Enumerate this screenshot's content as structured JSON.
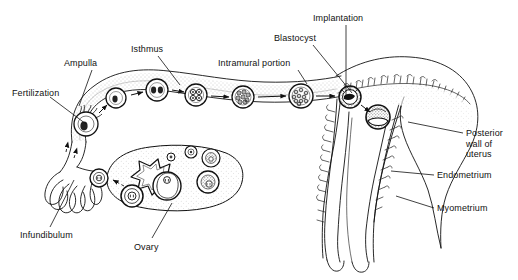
{
  "figure": {
    "title_visible": false,
    "background_color": "#ffffff",
    "ink_color": "#111111"
  },
  "labels": [
    {
      "id": "fertilization",
      "text": "Fertilization",
      "x": 12,
      "y": 88,
      "align": "left"
    },
    {
      "id": "ampulla",
      "text": "Ampulla",
      "x": 64,
      "y": 58,
      "align": "left"
    },
    {
      "id": "isthmus",
      "text": "Isthmus",
      "x": 131,
      "y": 44,
      "align": "left"
    },
    {
      "id": "intramural-portion",
      "text": "Intramural portion",
      "x": 218,
      "y": 58,
      "align": "left"
    },
    {
      "id": "blastocyst",
      "text": "Blastocyst",
      "x": 274,
      "y": 33,
      "align": "left"
    },
    {
      "id": "implantation",
      "text": "Implantation",
      "x": 313,
      "y": 13,
      "align": "left"
    },
    {
      "id": "posterior-wall",
      "text": "Posterior\nwall of\nuterus",
      "x": 466,
      "y": 128,
      "align": "left"
    },
    {
      "id": "endometrium",
      "text": "Endometrium",
      "x": 437,
      "y": 170,
      "align": "left"
    },
    {
      "id": "myometrium",
      "text": "Myometrium",
      "x": 437,
      "y": 203,
      "align": "left"
    },
    {
      "id": "infundibulum",
      "text": "Infundibulum",
      "x": 20,
      "y": 230,
      "align": "left"
    },
    {
      "id": "ovary",
      "text": "Ovary",
      "x": 134,
      "y": 242,
      "align": "left"
    }
  ],
  "leader_lines": [
    {
      "id": "leader-fertilization",
      "from": [
        62,
        97
      ],
      "to": [
        86,
        121
      ]
    },
    {
      "id": "leader-ampulla",
      "from": [
        92,
        70
      ],
      "to": [
        79,
        104
      ]
    },
    {
      "id": "leader-isthmus",
      "from": [
        158,
        56
      ],
      "to": [
        178,
        85
      ]
    },
    {
      "id": "leader-intramural",
      "from": [
        297,
        70
      ],
      "to": [
        306,
        83
      ]
    },
    {
      "id": "leader-blastocyst",
      "from": [
        313,
        45
      ],
      "to": [
        351,
        93
      ]
    },
    {
      "id": "leader-implantation",
      "from": [
        346,
        25
      ],
      "to": [
        346,
        97
      ]
    },
    {
      "id": "leader-posterior-wall",
      "from": [
        463,
        132
      ],
      "to": [
        408,
        121
      ]
    },
    {
      "id": "leader-endometrium",
      "from": [
        434,
        175
      ],
      "to": [
        393,
        171
      ]
    },
    {
      "id": "leader-myometrium",
      "from": [
        434,
        208
      ],
      "to": [
        396,
        196
      ]
    },
    {
      "id": "leader-infundibulum",
      "from": [
        50,
        227
      ],
      "to": [
        74,
        180
      ]
    },
    {
      "id": "leader-ovary",
      "from": [
        152,
        238
      ],
      "to": [
        172,
        203
      ]
    }
  ],
  "stages": [
    {
      "id": "stage-fertilization",
      "name": "fertilization-ovum-with-sperm",
      "cx": 86,
      "cy": 124,
      "r": 12,
      "cells": 1,
      "sperm": true
    },
    {
      "id": "stage-zygote",
      "name": "zygote",
      "cx": 116,
      "cy": 98,
      "r": 10,
      "cells": 1,
      "sperm": false
    },
    {
      "id": "stage-2cell",
      "name": "two-cell-stage",
      "cx": 157,
      "cy": 90,
      "r": 11,
      "cells": 2,
      "sperm": false
    },
    {
      "id": "stage-4cell",
      "name": "four-cell-stage",
      "cx": 196,
      "cy": 95,
      "r": 11,
      "cells": 4,
      "sperm": false
    },
    {
      "id": "stage-morula",
      "name": "morula",
      "cx": 243,
      "cy": 97,
      "r": 11,
      "cells": 9,
      "sperm": false
    },
    {
      "id": "stage-blastocyst",
      "name": "blastocyst",
      "cx": 301,
      "cy": 96,
      "r": 12,
      "cells": 14,
      "sperm": false
    },
    {
      "id": "stage-attaching",
      "name": "attaching-blastocyst",
      "cx": 350,
      "cy": 97,
      "r": 11,
      "cells": 0,
      "sperm": false
    },
    {
      "id": "stage-implanted",
      "name": "implanted-blastocyst",
      "cx": 378,
      "cy": 117,
      "r": 12,
      "cells": 0,
      "sperm": false
    }
  ],
  "arrows": [
    {
      "id": "arrow-1",
      "from": [
        97,
        112
      ],
      "to": [
        106,
        104
      ]
    },
    {
      "id": "arrow-2",
      "from": [
        131,
        94
      ],
      "to": [
        144,
        91
      ]
    },
    {
      "id": "arrow-3",
      "from": [
        171,
        90
      ],
      "to": [
        184,
        92
      ]
    },
    {
      "id": "arrow-4",
      "from": [
        210,
        96
      ],
      "to": [
        230,
        97
      ]
    },
    {
      "id": "arrow-5",
      "from": [
        257,
        97
      ],
      "to": [
        287,
        96
      ]
    },
    {
      "id": "arrow-6",
      "from": [
        315,
        96
      ],
      "to": [
        336,
        96
      ]
    },
    {
      "id": "arrow-7",
      "from": [
        360,
        105
      ],
      "to": [
        370,
        112
      ]
    },
    {
      "id": "arrow-ovulation",
      "from": [
        130,
        184
      ],
      "to": [
        113,
        178
      ]
    },
    {
      "id": "arrow-uptake",
      "from": [
        66,
        150
      ],
      "to": [
        69,
        140
      ]
    }
  ],
  "ovary": {
    "id": "ovary-body",
    "corpus_luteum": "jagged-star-shaped corpus luteum",
    "follicles": [
      {
        "id": "follicle-primordial-1",
        "cx": 171,
        "cy": 157,
        "r": 4,
        "stage": "primordial"
      },
      {
        "id": "follicle-primordial-2",
        "cx": 191,
        "cy": 152,
        "r": 6,
        "stage": "primary"
      },
      {
        "id": "follicle-secondary",
        "cx": 211,
        "cy": 158,
        "r": 9,
        "stage": "secondary"
      },
      {
        "id": "follicle-antral",
        "cx": 208,
        "cy": 182,
        "r": 11,
        "stage": "antral"
      },
      {
        "id": "follicle-graafian",
        "cx": 167,
        "cy": 186,
        "r": 14,
        "stage": "graafian"
      },
      {
        "id": "follicle-ruptured",
        "cx": 132,
        "cy": 196,
        "r": 11,
        "stage": "ruptured-ovulating"
      }
    ],
    "released_oocyte": {
      "id": "released-oocyte",
      "cx": 99,
      "cy": 178,
      "r": 9
    }
  },
  "structures": [
    {
      "id": "fallopian-tube",
      "name": "fallopian-tube"
    },
    {
      "id": "fimbriae",
      "name": "fimbriae-of-infundibulum"
    },
    {
      "id": "uterus-body",
      "name": "uterine-body"
    },
    {
      "id": "endometrial-lining",
      "name": "endometrial-lining-with-glands"
    },
    {
      "id": "uterine-cavity",
      "name": "uterine-cavity"
    },
    {
      "id": "cervical-canal",
      "name": "cervical-canal"
    }
  ]
}
